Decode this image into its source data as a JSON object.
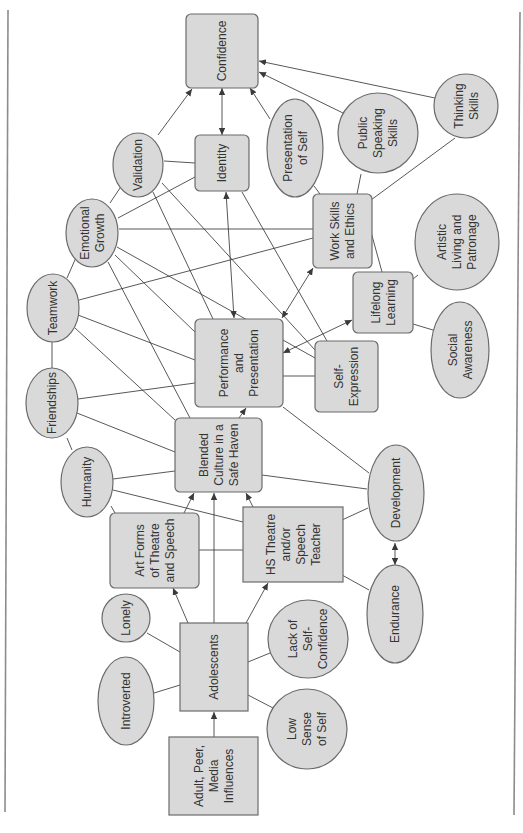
{
  "diagram": {
    "kind": "concept map",
    "colors": {
      "node_fill": "#d9d9d9",
      "node_stroke": "#6b6b6b",
      "edge": "#3a3a3a",
      "text": "#333333",
      "frame": "#8c8c8c"
    },
    "nodes": [
      {
        "id": "confidence",
        "shape": "rounded-box",
        "lines": [
          "Confidence"
        ]
      },
      {
        "id": "identity",
        "shape": "rounded-box",
        "lines": [
          "Identity"
        ]
      },
      {
        "id": "validation",
        "shape": "ellipse",
        "lines": [
          "Validation"
        ]
      },
      {
        "id": "emotional_growth",
        "shape": "ellipse",
        "lines": [
          "Emotional",
          "Growth"
        ]
      },
      {
        "id": "presentation_of_self",
        "shape": "ellipse",
        "lines": [
          "Presentation",
          "of Self"
        ]
      },
      {
        "id": "public_speaking_skills",
        "shape": "ellipse",
        "lines": [
          "Public",
          "Speaking",
          "Skills"
        ]
      },
      {
        "id": "thinking_skills",
        "shape": "ellipse",
        "lines": [
          "Thinking",
          "Skills"
        ]
      },
      {
        "id": "work_skills_and_ethics",
        "shape": "rounded-box",
        "lines": [
          "Work Skills",
          "and Ethics"
        ]
      },
      {
        "id": "artistic_living_and_patronage",
        "shape": "ellipse",
        "lines": [
          "Artistic",
          "Living and",
          "Patronage"
        ]
      },
      {
        "id": "lifelong_learning",
        "shape": "rounded-box",
        "lines": [
          "Lifelong",
          "Learning"
        ]
      },
      {
        "id": "social_awareness",
        "shape": "ellipse",
        "lines": [
          "Social",
          "Awareness"
        ]
      },
      {
        "id": "self_expression",
        "shape": "rounded-box",
        "lines": [
          "Self-",
          "Expression"
        ]
      },
      {
        "id": "performance_and_presentation",
        "shape": "rounded-box",
        "lines": [
          "Performance",
          "and",
          "Presentation"
        ]
      },
      {
        "id": "teamwork",
        "shape": "ellipse",
        "lines": [
          "Teamwork"
        ]
      },
      {
        "id": "friendships",
        "shape": "ellipse",
        "lines": [
          "Friendships"
        ]
      },
      {
        "id": "humanity",
        "shape": "ellipse",
        "lines": [
          "Humanity"
        ]
      },
      {
        "id": "blended_culture",
        "shape": "rounded-box",
        "lines": [
          "Blended",
          "Culture in a",
          "Safe Haven"
        ]
      },
      {
        "id": "development",
        "shape": "ellipse",
        "lines": [
          "Development"
        ]
      },
      {
        "id": "art_forms",
        "shape": "rounded-box",
        "lines": [
          "Art Forms",
          "of Theatre",
          "and Speech"
        ]
      },
      {
        "id": "hs_theatre_teacher",
        "shape": "box",
        "lines": [
          "HS Theatre",
          "and/or",
          "Speech",
          "Teacher"
        ]
      },
      {
        "id": "endurance",
        "shape": "ellipse",
        "lines": [
          "Endurance"
        ]
      },
      {
        "id": "lonely",
        "shape": "ellipse",
        "lines": [
          "Lonely"
        ]
      },
      {
        "id": "introverted",
        "shape": "ellipse",
        "lines": [
          "Introverted"
        ]
      },
      {
        "id": "adolescents",
        "shape": "box",
        "lines": [
          "Adolescents"
        ]
      },
      {
        "id": "lack_of_self_confidence",
        "shape": "ellipse",
        "lines": [
          "Lack of",
          "Self-",
          "Confidence"
        ]
      },
      {
        "id": "low_sense_of_self",
        "shape": "ellipse",
        "lines": [
          "Low",
          "Sense",
          "of Self"
        ]
      },
      {
        "id": "adult_peer_media_influences",
        "shape": "box",
        "lines": [
          "Adult, Peer,",
          "Media",
          "Influences"
        ]
      }
    ],
    "edges": [
      {
        "from": "validation",
        "to": "confidence",
        "type": "arrow"
      },
      {
        "from": "identity",
        "to": "confidence",
        "type": "double-arrow"
      },
      {
        "from": "presentation_of_self",
        "to": "confidence",
        "type": "arrow"
      },
      {
        "from": "public_speaking_skills",
        "to": "confidence",
        "type": "arrow"
      },
      {
        "from": "thinking_skills",
        "to": "confidence",
        "type": "arrow"
      },
      {
        "from": "validation",
        "to": "identity",
        "type": "line"
      },
      {
        "from": "validation",
        "to": "emotional_growth",
        "type": "line"
      },
      {
        "from": "emotional_growth",
        "to": "identity",
        "type": "line"
      },
      {
        "from": "emotional_growth",
        "to": "work_skills_and_ethics",
        "type": "line"
      },
      {
        "from": "presentation_of_self",
        "to": "work_skills_and_ethics",
        "type": "line"
      },
      {
        "from": "public_speaking_skills",
        "to": "work_skills_and_ethics",
        "type": "line"
      },
      {
        "from": "thinking_skills",
        "to": "work_skills_and_ethics",
        "type": "line"
      },
      {
        "from": "work_skills_and_ethics",
        "to": "lifelong_learning",
        "type": "line"
      },
      {
        "from": "artistic_living_and_patronage",
        "to": "lifelong_learning",
        "type": "line"
      },
      {
        "from": "social_awareness",
        "to": "lifelong_learning",
        "type": "line"
      },
      {
        "from": "identity",
        "to": "performance_and_presentation",
        "type": "double-arrow"
      },
      {
        "from": "identity",
        "to": "self_expression",
        "type": "line"
      },
      {
        "from": "validation",
        "to": "performance_and_presentation",
        "type": "line"
      },
      {
        "from": "validation",
        "to": "self_expression",
        "type": "line"
      },
      {
        "from": "emotional_growth",
        "to": "performance_and_presentation",
        "type": "line"
      },
      {
        "from": "emotional_growth",
        "to": "self_expression",
        "type": "line"
      },
      {
        "from": "emotional_growth",
        "to": "blended_culture",
        "type": "line"
      },
      {
        "from": "emotional_growth",
        "to": "teamwork",
        "type": "line"
      },
      {
        "from": "teamwork",
        "to": "work_skills_and_ethics",
        "type": "line"
      },
      {
        "from": "teamwork",
        "to": "performance_and_presentation",
        "type": "line"
      },
      {
        "from": "teamwork",
        "to": "blended_culture",
        "type": "line"
      },
      {
        "from": "teamwork",
        "to": "friendships",
        "type": "line"
      },
      {
        "from": "friendships",
        "to": "performance_and_presentation",
        "type": "line"
      },
      {
        "from": "friendships",
        "to": "blended_culture",
        "type": "line"
      },
      {
        "from": "friendships",
        "to": "humanity",
        "type": "line"
      },
      {
        "from": "humanity",
        "to": "blended_culture",
        "type": "line"
      },
      {
        "from": "humanity",
        "to": "hs_theatre_teacher",
        "type": "line"
      },
      {
        "from": "humanity",
        "to": "art_forms",
        "type": "line"
      },
      {
        "from": "performance_and_presentation",
        "to": "work_skills_and_ethics",
        "type": "double-arrow"
      },
      {
        "from": "performance_and_presentation",
        "to": "lifelong_learning",
        "type": "double-arrow"
      },
      {
        "from": "performance_and_presentation",
        "to": "self_expression",
        "type": "line"
      },
      {
        "from": "blended_culture",
        "to": "performance_and_presentation",
        "type": "arrow"
      },
      {
        "from": "performance_and_presentation",
        "to": "development",
        "type": "line"
      },
      {
        "from": "blended_culture",
        "to": "development",
        "type": "line"
      },
      {
        "from": "art_forms",
        "to": "blended_culture",
        "type": "arrow"
      },
      {
        "from": "adolescents",
        "to": "blended_culture",
        "type": "arrow"
      },
      {
        "from": "hs_theatre_teacher",
        "to": "blended_culture",
        "type": "arrow"
      },
      {
        "from": "art_forms",
        "to": "hs_theatre_teacher",
        "type": "line"
      },
      {
        "from": "hs_theatre_teacher",
        "to": "development",
        "type": "line"
      },
      {
        "from": "hs_theatre_teacher",
        "to": "endurance",
        "type": "line"
      },
      {
        "from": "development",
        "to": "endurance",
        "type": "double-arrow"
      },
      {
        "from": "adolescents",
        "to": "art_forms",
        "type": "arrow"
      },
      {
        "from": "adolescents",
        "to": "hs_theatre_teacher",
        "type": "arrow"
      },
      {
        "from": "lonely",
        "to": "adolescents",
        "type": "line"
      },
      {
        "from": "introverted",
        "to": "adolescents",
        "type": "line"
      },
      {
        "from": "lack_of_self_confidence",
        "to": "adolescents",
        "type": "line"
      },
      {
        "from": "low_sense_of_self",
        "to": "adolescents",
        "type": "line"
      },
      {
        "from": "adult_peer_media_influences",
        "to": "adolescents",
        "type": "arrow"
      }
    ]
  }
}
